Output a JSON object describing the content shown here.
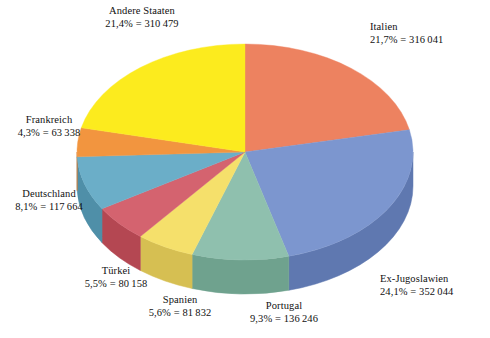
{
  "chart_data": {
    "type": "pie",
    "title": "",
    "subtitle": "",
    "xlabel": "",
    "ylabel": "",
    "legend_position": "none",
    "grid": false,
    "three_d": true,
    "start_angle_deg": 0,
    "direction": "clockwise",
    "categories": [
      "Italien",
      "Ex-Jugoslawien",
      "Portugal",
      "Spanien",
      "Türkei",
      "Deutschland",
      "Frankreich",
      "Andere Staaten"
    ],
    "values": [
      316041,
      352044,
      136246,
      81832,
      80158,
      117664,
      63338,
      310479
    ],
    "percents": [
      21.7,
      24.1,
      9.3,
      5.6,
      5.5,
      8.1,
      4.3,
      21.4
    ],
    "colors": [
      "#ED8260",
      "#7C96CF",
      "#8FC0AE",
      "#F5E06B",
      "#D4636F",
      "#6BAEC8",
      "#F2953F",
      "#FCEB1E"
    ],
    "slices": [
      {
        "name": "Italien",
        "percent": 21.7,
        "value": 316041,
        "percent_text": "21,7%",
        "value_text": "316 041",
        "label_line1": "Italien",
        "label_line2": "21,7% = 316 041",
        "color": "#ED8260",
        "side_color": "#D4653F"
      },
      {
        "name": "Ex-Jugoslawien",
        "percent": 24.1,
        "value": 352044,
        "percent_text": "24,1%",
        "value_text": "352 044",
        "label_line1": "Ex-Jugoslawien",
        "label_line2": "24,1% = 352 044",
        "color": "#7C96CF",
        "side_color": "#5F78B0"
      },
      {
        "name": "Portugal",
        "percent": 9.3,
        "value": 136246,
        "percent_text": "9,3%",
        "value_text": "136 246",
        "label_line1": "Portugal",
        "label_line2": "9,3% = 136 246",
        "color": "#8FC0AE",
        "side_color": "#6FA28E"
      },
      {
        "name": "Spanien",
        "percent": 5.6,
        "value": 81832,
        "percent_text": "5,6%",
        "value_text": "81 832",
        "label_line1": "Spanien",
        "label_line2": "5,6% = 81 832",
        "color": "#F5E06B",
        "side_color": "#D6BF52"
      },
      {
        "name": "Türkei",
        "percent": 5.5,
        "value": 80158,
        "percent_text": "5,5%",
        "value_text": "80 158",
        "label_line1": "Türkei",
        "label_line2": "5,5% = 80 158",
        "color": "#D4636F",
        "side_color": "#B44752"
      },
      {
        "name": "Deutschland",
        "percent": 8.1,
        "value": 117664,
        "percent_text": "8,1%",
        "value_text": "117 664",
        "label_line1": "Deutschland",
        "label_line2": "8,1% = 117 664",
        "color": "#6BAEC8",
        "side_color": "#4F8FA8"
      },
      {
        "name": "Frankreich",
        "percent": 4.3,
        "value": 63338,
        "percent_text": "4,3%",
        "value_text": "4,3% = 63 338",
        "label_line1": "Frankreich",
        "label_line2": "4,3% = 63 338",
        "color": "#F2953F",
        "side_color": "#D2762A"
      },
      {
        "name": "Andere Staaten",
        "percent": 21.4,
        "value": 310479,
        "percent_text": "21,4%",
        "value_text": "310 479",
        "label_line1": "Andere Staaten",
        "label_line2": "21,4% = 310 479",
        "color": "#FCEB1E",
        "side_color": "#DCC911"
      }
    ]
  },
  "labels": {
    "andere": {
      "name": "Andere Staaten",
      "value": "21,4% = 310 479"
    },
    "italien": {
      "name": "Italien",
      "value": "21,7% = 316 041"
    },
    "exjugo": {
      "name": "Ex-Jugoslawien",
      "value": "24,1% = 352 044"
    },
    "portugal": {
      "name": "Portugal",
      "value": "9,3% = 136 246"
    },
    "spanien": {
      "name": "Spanien",
      "value": "5,6% = 81 832"
    },
    "tuerkei": {
      "name": "Türkei",
      "value": "5,5% = 80 158"
    },
    "deutschland": {
      "name": "Deutschland",
      "value": "8,1% = 117 664"
    },
    "frankreich": {
      "name": "Frankreich",
      "value": "4,3% = 63 338"
    }
  }
}
